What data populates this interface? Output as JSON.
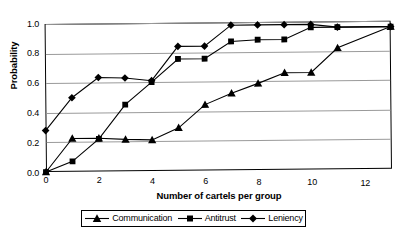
{
  "chart_data": {
    "type": "line",
    "title": "",
    "xlabel": "Number of cartels per group",
    "ylabel": "Probability",
    "xlim": [
      0,
      13
    ],
    "ylim": [
      0,
      1.0
    ],
    "xticks": [
      "0",
      "2",
      "4",
      "6",
      "8",
      "10",
      "12"
    ],
    "xtick_values": [
      0,
      2,
      4,
      6,
      8,
      10,
      12
    ],
    "yticks": [
      "0.0",
      "0.2",
      "0.4",
      "0.6",
      "0.8",
      "1.0"
    ],
    "ytick_values": [
      0.0,
      0.2,
      0.4,
      0.6,
      0.8,
      1.0
    ],
    "grid": true,
    "legend_position": "bottom",
    "x": [
      0,
      1,
      2,
      3,
      4,
      5,
      6,
      7,
      8,
      9,
      10,
      11,
      13
    ],
    "series": [
      {
        "name": "Communication",
        "marker": "triangle",
        "color": "#000000",
        "values": [
          0.0,
          0.225,
          0.225,
          0.215,
          0.21,
          0.29,
          0.445,
          0.52,
          0.585,
          0.655,
          0.655,
          0.82,
          0.96
        ]
      },
      {
        "name": "Antitrust",
        "marker": "square",
        "color": "#000000",
        "values": [
          0.0,
          0.07,
          0.22,
          0.45,
          0.6,
          0.755,
          0.755,
          0.87,
          0.88,
          0.88,
          0.96,
          0.96,
          0.96
        ]
      },
      {
        "name": "Leniency",
        "marker": "diamond",
        "color": "#000000",
        "values": [
          0.28,
          0.5,
          0.635,
          0.63,
          0.61,
          0.84,
          0.84,
          0.98,
          0.98,
          0.98,
          0.98,
          0.96,
          0.96
        ]
      }
    ]
  },
  "caption": ""
}
